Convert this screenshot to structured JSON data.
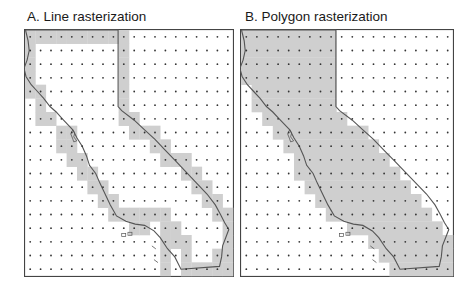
{
  "figure": {
    "panels": [
      {
        "id": "A",
        "title": "A. Line rasterization",
        "method": "line",
        "shaded_cells": [
          [
            0,
            0
          ],
          [
            0,
            1
          ],
          [
            0,
            2
          ],
          [
            0,
            3
          ],
          [
            0,
            4
          ],
          [
            0,
            5
          ],
          [
            0,
            6
          ],
          [
            0,
            7
          ],
          [
            0,
            8
          ],
          [
            0,
            9
          ],
          [
            1,
            0
          ],
          [
            1,
            9
          ],
          [
            2,
            0
          ],
          [
            2,
            9
          ],
          [
            3,
            0
          ],
          [
            3,
            9
          ],
          [
            4,
            0
          ],
          [
            4,
            1
          ],
          [
            4,
            9
          ],
          [
            5,
            1
          ],
          [
            5,
            9
          ],
          [
            6,
            1
          ],
          [
            6,
            2
          ],
          [
            6,
            9
          ],
          [
            6,
            10
          ],
          [
            7,
            3
          ],
          [
            7,
            4
          ],
          [
            7,
            10
          ],
          [
            7,
            11
          ],
          [
            7,
            12
          ],
          [
            8,
            3
          ],
          [
            8,
            4
          ],
          [
            8,
            12
          ],
          [
            8,
            13
          ],
          [
            9,
            4
          ],
          [
            9,
            5
          ],
          [
            9,
            13
          ],
          [
            9,
            14
          ],
          [
            9,
            15
          ],
          [
            10,
            5
          ],
          [
            10,
            6
          ],
          [
            10,
            15
          ],
          [
            10,
            16
          ],
          [
            11,
            6
          ],
          [
            11,
            7
          ],
          [
            11,
            16
          ],
          [
            11,
            17
          ],
          [
            12,
            7
          ],
          [
            12,
            8
          ],
          [
            12,
            17
          ],
          [
            12,
            18
          ],
          [
            13,
            8
          ],
          [
            13,
            9
          ],
          [
            13,
            10
          ],
          [
            13,
            11
          ],
          [
            13,
            12
          ],
          [
            13,
            13
          ],
          [
            13,
            18
          ],
          [
            13,
            19
          ],
          [
            14,
            10
          ],
          [
            14,
            11
          ],
          [
            14,
            13
          ],
          [
            14,
            14
          ],
          [
            14,
            19
          ],
          [
            15,
            13
          ],
          [
            15,
            14
          ],
          [
            15,
            15
          ],
          [
            15,
            19
          ],
          [
            16,
            13
          ],
          [
            16,
            15
          ],
          [
            16,
            18
          ],
          [
            16,
            19
          ],
          [
            17,
            13
          ],
          [
            17,
            15
          ],
          [
            17,
            16
          ],
          [
            17,
            17
          ],
          [
            17,
            18
          ],
          [
            17,
            19
          ]
        ]
      },
      {
        "id": "B",
        "title": "B. Polygon rasterization",
        "method": "polygon",
        "filled_row_ranges": [
          [
            0,
            0,
            8
          ],
          [
            1,
            0,
            8
          ],
          [
            2,
            0,
            8
          ],
          [
            3,
            0,
            8
          ],
          [
            4,
            1,
            8
          ],
          [
            5,
            1,
            8
          ],
          [
            6,
            2,
            9
          ],
          [
            7,
            3,
            11
          ],
          [
            8,
            4,
            12
          ],
          [
            9,
            5,
            13
          ],
          [
            10,
            5,
            14
          ],
          [
            11,
            6,
            15
          ],
          [
            12,
            7,
            16
          ],
          [
            13,
            8,
            17
          ],
          [
            14,
            10,
            18
          ],
          [
            15,
            12,
            19
          ],
          [
            16,
            13,
            19
          ],
          [
            17,
            14,
            19
          ]
        ]
      }
    ],
    "grid": {
      "columns": 20,
      "rows": 18
    },
    "colors": {
      "shade": "#cfcfcf",
      "outline": "#555555",
      "dot": "#333333",
      "frame": "#444444"
    }
  }
}
